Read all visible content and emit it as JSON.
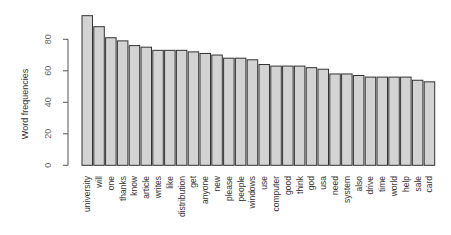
{
  "chart_data": {
    "type": "bar",
    "title": "",
    "xlabel": "",
    "ylabel": "Word frequencies",
    "ylim": [
      0,
      95
    ],
    "yticks": [
      0,
      20,
      40,
      60,
      80
    ],
    "grid": false,
    "legend": null,
    "categories": [
      "university",
      "will",
      "one",
      "thanks",
      "know",
      "article",
      "writes",
      "like",
      "distribution",
      "get",
      "anyone",
      "new",
      "please",
      "people",
      "windows",
      "use",
      "computer",
      "good",
      "think",
      "god",
      "usa",
      "need",
      "system",
      "also",
      "drive",
      "time",
      "world",
      "help",
      "sale",
      "card"
    ],
    "values": [
      95,
      88,
      81,
      79,
      76,
      75,
      73,
      73,
      73,
      72,
      71,
      70,
      68,
      68,
      67,
      64,
      63,
      63,
      63,
      62,
      61,
      58,
      58,
      57,
      56,
      56,
      56,
      56,
      54,
      53
    ],
    "bar_color": "#d3d3d3",
    "bar_border_color": "#333333"
  }
}
